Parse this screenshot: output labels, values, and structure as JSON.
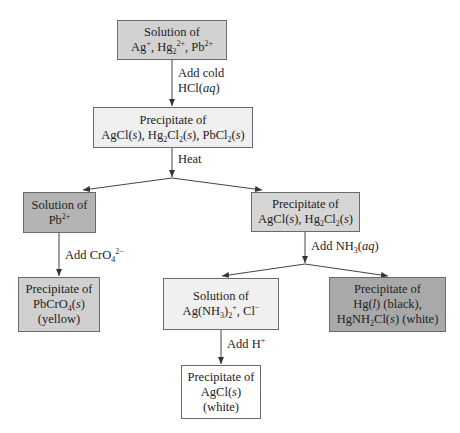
{
  "diagram": {
    "nodes": [
      {
        "id": "start",
        "line1": "Solution of",
        "line2": "Ag+, Hg2 2+, Pb2+",
        "fill": "#d2d2d2"
      },
      {
        "id": "ppt1",
        "line1": "Precipitate of",
        "line2": "AgCl(s), Hg2Cl2(s), PbCl2(s)",
        "fill": "#efefef"
      },
      {
        "id": "pb_sol",
        "line1": "Solution of",
        "line2": "Pb2+",
        "fill": "#b4b4b4"
      },
      {
        "id": "ppt2",
        "line1": "Precipitate of",
        "line2": "AgCl(s), Hg2Cl2(s)",
        "fill": "#d6d6d6"
      },
      {
        "id": "pbcro4",
        "line1": "Precipitate of",
        "line2": "PbCrO4(s)",
        "line3": "(yellow)",
        "fill": "#d0d0d0"
      },
      {
        "id": "agnh3",
        "line1": "Solution of",
        "line2": "Ag(NH3)2+, Cl-",
        "fill": "#f0f0f0"
      },
      {
        "id": "hg",
        "line1": "Precipitate of",
        "line2": "Hg(l) (black),",
        "line3": "HgNH2Cl(s) (white)",
        "fill": "#a9a9a9"
      },
      {
        "id": "agcl",
        "line1": "Precipitate of",
        "line2": "AgCl(s)",
        "line3": "(white)",
        "fill": "#ffffff"
      }
    ],
    "edges": [
      {
        "from": "start",
        "to": "ppt1",
        "label_line1": "Add cold",
        "label_line2": "HCl(aq)"
      },
      {
        "from": "ppt1",
        "to": "pb_sol",
        "label": "Heat"
      },
      {
        "from": "ppt1",
        "to": "ppt2",
        "label": "Heat"
      },
      {
        "from": "pb_sol",
        "to": "pbcro4",
        "label": "Add CrO4 2-"
      },
      {
        "from": "ppt2",
        "to": "agnh3",
        "label": "Add NH3(aq)"
      },
      {
        "from": "ppt2",
        "to": "hg",
        "label": "Add NH3(aq)"
      },
      {
        "from": "agnh3",
        "to": "agcl",
        "label": "Add H+"
      }
    ]
  }
}
